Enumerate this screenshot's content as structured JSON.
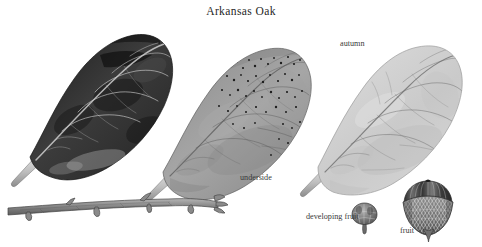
{
  "plate": {
    "title": "Arkansas Oak",
    "background_color": "#ffffff",
    "width": 482,
    "height": 247,
    "medium": "grayscale botanical illustration"
  },
  "labels": {
    "autumn": "autumn",
    "underside": "underside",
    "developing_fruit": "developing fruit",
    "fruit": "fruit"
  },
  "specimens": [
    {
      "name": "leaf-upper-surface",
      "label": "",
      "tone": "very dark, near black",
      "fill": "#3a3a3a",
      "description": "obovate spatulate leaf, upper surface, pale midrib and secondary veins"
    },
    {
      "name": "leaf-underside",
      "label": "underside",
      "tone": "medium gray",
      "fill": "#9a9a9a",
      "description": "obovate leaf, lower surface with dark speckles in upper half"
    },
    {
      "name": "leaf-autumn",
      "label": "autumn",
      "tone": "light gray",
      "fill": "#d2d2d2",
      "description": "obovate autumn leaf, pale with fine dark veins"
    },
    {
      "name": "twig",
      "label": "",
      "tone": "mid gray",
      "fill": "#8f8f8f",
      "description": "horizontal twig with lateral buds and a terminal bud cluster"
    },
    {
      "name": "developing-fruit",
      "label": "developing fruit",
      "tone": "mid gray",
      "fill": "#8a8a8a",
      "description": "small immature acorn on a short stalk"
    },
    {
      "name": "fruit",
      "label": "fruit",
      "tone": "dark gray",
      "fill": "#555555",
      "description": "mature acorn, striated nut with scaly cup and pointed tip"
    }
  ],
  "colors": {
    "ink": "#2b2b2b",
    "leaf_dark": "#3a3a3a",
    "leaf_mid": "#9a9a9a",
    "leaf_light": "#d2d2d2",
    "twig": "#8f8f8f",
    "paper": "#ffffff"
  }
}
